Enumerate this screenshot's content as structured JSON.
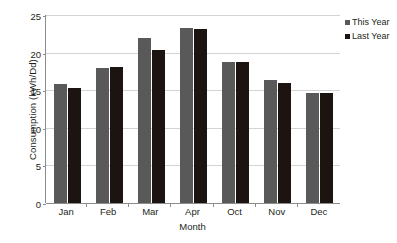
{
  "chart_data": {
    "type": "bar",
    "title": "",
    "xlabel": "Month",
    "ylabel": "Consumption (kWh/Dd)",
    "categories": [
      "Jan",
      "Feb",
      "Mar",
      "Apr",
      "Oct",
      "Nov",
      "Dec"
    ],
    "series": [
      {
        "name": "This Year",
        "color": "#595959",
        "values": [
          15.8,
          17.9,
          21.9,
          23.3,
          18.8,
          16.4,
          14.6
        ]
      },
      {
        "name": "Last Year",
        "color": "#1c1410",
        "values": [
          15.3,
          18.1,
          20.4,
          23.1,
          18.8,
          15.9,
          14.6
        ]
      }
    ],
    "ylim": [
      0,
      25
    ],
    "yticks": [
      0,
      5,
      10,
      15,
      20,
      25
    ],
    "ytick_labels": [
      "0",
      "5",
      "10",
      "15",
      "20",
      "25"
    ],
    "grid": true,
    "legend_position": "right"
  }
}
